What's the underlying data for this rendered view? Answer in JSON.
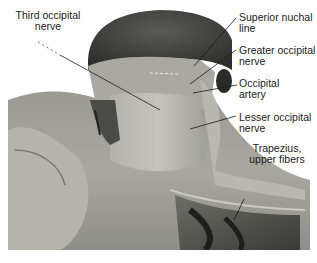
{
  "figure": {
    "labels": [
      {
        "id": "third-occipital-nerve",
        "lines": [
          "Third occipital",
          "nerve"
        ]
      },
      {
        "id": "superior-nuchal-line",
        "lines": [
          "Superior nuchal",
          "line"
        ]
      },
      {
        "id": "greater-occipital-nerve",
        "lines": [
          "Greater occipital",
          "nerve"
        ]
      },
      {
        "id": "occipital-artery",
        "lines": [
          "Occipital",
          "artery"
        ]
      },
      {
        "id": "lesser-occipital-nerve",
        "lines": [
          "Lesser occipital",
          "nerve"
        ]
      },
      {
        "id": "trapezius-upper-fibers",
        "lines": [
          "Trapezius,",
          "upper fibers"
        ]
      }
    ]
  }
}
